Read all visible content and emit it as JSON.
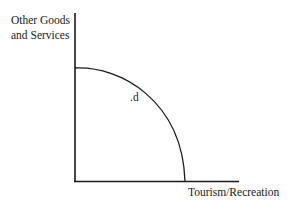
{
  "diagram": {
    "type": "production-possibility-frontier",
    "y_axis_label_line1": "Other Goods",
    "y_axis_label_line2": "and Services",
    "x_axis_label": "Tourism/Recreation",
    "point_label": ".d",
    "colors": {
      "line": "#1a1a1a",
      "background": "#ffffff"
    }
  }
}
